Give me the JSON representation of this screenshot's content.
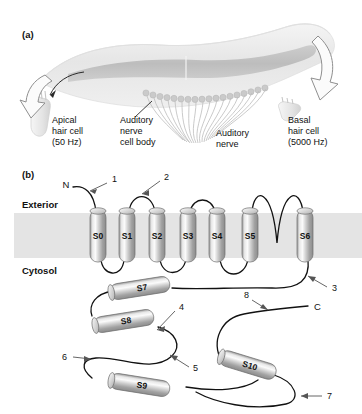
{
  "figure": {
    "panel_a": {
      "label": "(a)",
      "annotations": [
        {
          "id": "apical",
          "lines": [
            "Apical",
            "hair cell",
            "(50 Hz)"
          ]
        },
        {
          "id": "nerve-cell-body",
          "lines": [
            "Auditory",
            "nerve",
            "cell body"
          ]
        },
        {
          "id": "auditory-nerve",
          "lines": [
            "Auditory",
            "nerve"
          ]
        },
        {
          "id": "basal",
          "lines": [
            "Basal",
            "hair cell",
            "(5000 Hz)"
          ]
        }
      ]
    },
    "panel_b": {
      "label": "(b)",
      "compartment_top": "Exterior",
      "compartment_bottom": "Cytosol",
      "n_terminus": "N",
      "c_terminus": "C",
      "transmembrane_helices": [
        "S0",
        "S1",
        "S2",
        "S3",
        "S4",
        "S5",
        "S6"
      ],
      "cytosolic_helices": [
        "S7",
        "S8",
        "S9",
        "S10"
      ],
      "callouts": [
        "1",
        "2",
        "3",
        "4",
        "5",
        "6",
        "7",
        "8"
      ]
    }
  },
  "colors": {
    "membrane": "#e3e3e3",
    "helix_light": "#f2f2f2",
    "helix_mid": "#b9b9b9",
    "helix_dark": "#8a8a8a",
    "line": "#111111",
    "cochlea_pale": "#eaeaea",
    "cochlea_band": "#c2c2c2",
    "callout": "#555555"
  }
}
